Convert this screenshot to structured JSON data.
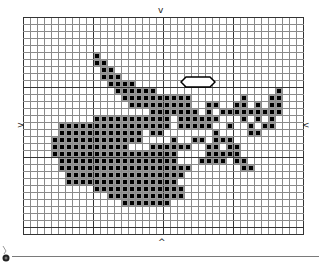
{
  "canvas": {
    "cols": 40,
    "rows": 31,
    "cell_size": 7,
    "major_every": 10,
    "grid_color": "#8a8a8a",
    "major_color": "#333333",
    "fill_color": "#000000",
    "fill_bg": "#9a9a9a"
  },
  "markers": {
    "top": "v",
    "bottom": "^",
    "left": ">",
    "right": "<"
  },
  "pattern": [
    "........................................",
    "........................................",
    "........................................",
    "........................................",
    "........................................",
    "..........#.............................",
    "..........##............................",
    "...........##...........................",
    "...........###..........................",
    "............####........................",
    ".............######.................#...",
    "..............##########.......#...##...",
    "...............#########..##..##.#.##...",
    "..................#######.#.#########...",
    "..........###########.######...#.#.#....",
    ".....################.#####..#..#.##....",
    ".....############.##.......#....##......",
    "....#############....#..##.###..........",
    "....###########...######..##.##.........",
    "....##################....#####.........",
    ".....#################...####.##........",
    ".....###################.......##.......",
    "......#################.................",
    "......################..................",
    "..........#############.................",
    "............###########.................",
    "..............#######...................",
    "........................................",
    "........................................",
    "........................................",
    "........................................"
  ],
  "selection": {
    "shape": "hexagon",
    "x": 182,
    "y": 78,
    "width": 32,
    "height": 8
  }
}
